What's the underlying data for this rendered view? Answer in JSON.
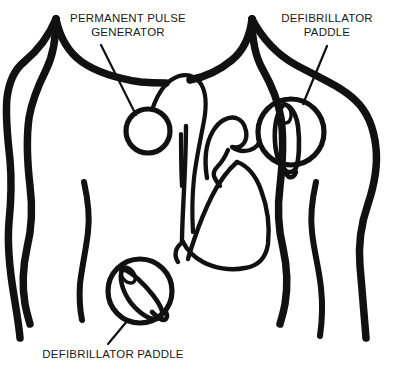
{
  "figure": {
    "background_color": "#ffffff",
    "ink_color": "#111111",
    "width": 410,
    "height": 369
  },
  "labels": {
    "pulse_generator": {
      "line1": "PERMANENT PULSE",
      "line2": "GENERATOR",
      "x": 128,
      "y1": 22,
      "y2": 36
    },
    "paddle_upper_right": {
      "line1": "DEFIBRILLATOR",
      "line2": "PADDLE",
      "x": 327,
      "y1": 22,
      "y2": 36
    },
    "paddle_lower_left": {
      "line1": "DEFIBRILLATOR PADDLE",
      "x": 113,
      "y1": 358
    }
  },
  "devices": [
    {
      "name": "permanent-pulse-generator",
      "type": "pulse-generator",
      "shape": "circle",
      "center_x": 148,
      "center_y": 131,
      "radius": 22
    },
    {
      "name": "defibrillator-paddle-upper-right",
      "type": "paddle",
      "shape": "circle-with-handle",
      "center_x": 291,
      "center_y": 132,
      "radius": 33,
      "handle_rotation_deg": 14
    },
    {
      "name": "defibrillator-paddle-lower-left",
      "type": "paddle",
      "shape": "circle-with-handle",
      "center_x": 140,
      "center_y": 291,
      "radius": 32,
      "handle_rotation_deg": 36
    }
  ],
  "anatomy": {
    "parts": [
      "neck-left",
      "neck-right",
      "shoulder-left",
      "shoulder-right",
      "arm-left-outer",
      "arm-right-outer",
      "torso-left-inner",
      "torso-right-inner",
      "heart",
      "aortic-arch",
      "pulmonary-trunk",
      "pacemaker-lead"
    ]
  }
}
